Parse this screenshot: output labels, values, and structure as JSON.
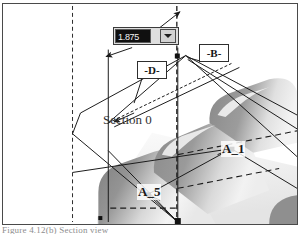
{
  "window": {
    "type": "cad-3d-viewport",
    "background_color": "#ffffff",
    "frame_color": "#4a4a4a"
  },
  "value_combo": {
    "name": "dimension-value-combobox",
    "value": "1.875",
    "placeholder": "1.875",
    "selected": true,
    "field_bg": "#101010",
    "field_fg": "#f2f2f2",
    "dropdown_icon": "chevron-down-icon",
    "widget_bg": "#dedede"
  },
  "datum_labels": [
    {
      "id": "datum-b",
      "text": "-B-"
    },
    {
      "id": "datum-d",
      "text": "-D-"
    }
  ],
  "annotations": {
    "section_label": "Section 0",
    "point_a1": "A_1",
    "point_a5": "A_5"
  },
  "caption": {
    "text": "Figure 4.12(b) Section view"
  },
  "geometry": {
    "line_color": "#1a1a1a",
    "construction_color": "#3d3d3d",
    "dash_pattern": "4,3",
    "shading": {
      "rib_dark": "#8d8d8d",
      "rib_mid": "#b4b4b4",
      "rib_light": "#e2e2e2",
      "highlight": "#f4f4f4"
    }
  }
}
